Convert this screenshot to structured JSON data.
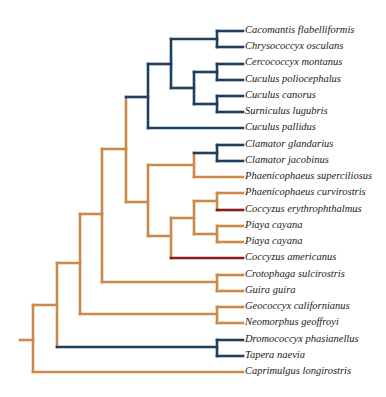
{
  "colors": {
    "orange": "#c98a4b",
    "blue": "#1f3f5e",
    "red": "#8b1a1a"
  },
  "tree": {
    "label_x": 245,
    "leaf_x": 243,
    "row_start_y": 31,
    "row_step": 16.24,
    "leaves": [
      {
        "label": "Cacomantis flabelliformis"
      },
      {
        "label": "Chrysococcyx osculans"
      },
      {
        "label": "Cercococcyx montanus"
      },
      {
        "label": "Cuculus poliocephalus"
      },
      {
        "label": "Cuculus canorus"
      },
      {
        "label": "Surniculus lugubris"
      },
      {
        "label": "Cuculus pallidus"
      },
      {
        "label": "Clamator glandarius"
      },
      {
        "label": "Clamator jacobinus"
      },
      {
        "label": "Phaenicophaeus superciliosus"
      },
      {
        "label": "Phaenicophaeus curvirostris"
      },
      {
        "label": "Coccyzus erythrophthalmus"
      },
      {
        "label": "Piaya cayana"
      },
      {
        "label": "Piaya cayana"
      },
      {
        "label": "Coccyzus americanus"
      },
      {
        "label": "Crotophaga sulcirostris"
      },
      {
        "label": "Guira guira"
      },
      {
        "label": "Geococcyx californianus"
      },
      {
        "label": "Neomorphus geoffroyi"
      },
      {
        "label": "Dromococcyx phasianellus"
      },
      {
        "label": "Tapera naevia"
      },
      {
        "label": "Caprimulgus longirostris"
      }
    ],
    "segments": [
      {
        "x1": 20,
        "y1": 340,
        "x2": 33,
        "y2": 340,
        "c": "orange"
      },
      {
        "x1": 33,
        "y1": 305,
        "x2": 33,
        "y2": 372,
        "c": "orange"
      },
      {
        "x1": 33,
        "y1": 372,
        "x2": 243,
        "y2": 372,
        "c": "orange"
      },
      {
        "x1": 33,
        "y1": 305,
        "x2": 57,
        "y2": 305,
        "c": "orange"
      },
      {
        "x1": 57,
        "y1": 263,
        "x2": 57,
        "y2": 347,
        "c": "orange"
      },
      {
        "x1": 57,
        "y1": 347,
        "x2": 217,
        "y2": 347,
        "c": "blue"
      },
      {
        "x1": 217,
        "y1": 340,
        "x2": 217,
        "y2": 356,
        "c": "blue"
      },
      {
        "x1": 217,
        "y1": 340,
        "x2": 243,
        "y2": 340,
        "c": "blue"
      },
      {
        "x1": 217,
        "y1": 356,
        "x2": 243,
        "y2": 356,
        "c": "blue"
      },
      {
        "x1": 57,
        "y1": 263,
        "x2": 80,
        "y2": 263,
        "c": "orange"
      },
      {
        "x1": 80,
        "y1": 214,
        "x2": 80,
        "y2": 314,
        "c": "orange"
      },
      {
        "x1": 80,
        "y1": 314,
        "x2": 217,
        "y2": 314,
        "c": "orange"
      },
      {
        "x1": 217,
        "y1": 307,
        "x2": 217,
        "y2": 323,
        "c": "orange"
      },
      {
        "x1": 217,
        "y1": 307,
        "x2": 243,
        "y2": 307,
        "c": "orange"
      },
      {
        "x1": 217,
        "y1": 323,
        "x2": 243,
        "y2": 323,
        "c": "orange"
      },
      {
        "x1": 80,
        "y1": 214,
        "x2": 102,
        "y2": 214,
        "c": "orange"
      },
      {
        "x1": 102,
        "y1": 149,
        "x2": 102,
        "y2": 282,
        "c": "orange"
      },
      {
        "x1": 102,
        "y1": 282,
        "x2": 217,
        "y2": 282,
        "c": "orange"
      },
      {
        "x1": 217,
        "y1": 275,
        "x2": 217,
        "y2": 291,
        "c": "orange"
      },
      {
        "x1": 217,
        "y1": 275,
        "x2": 243,
        "y2": 275,
        "c": "orange"
      },
      {
        "x1": 217,
        "y1": 291,
        "x2": 243,
        "y2": 291,
        "c": "orange"
      },
      {
        "x1": 102,
        "y1": 149,
        "x2": 126,
        "y2": 149,
        "c": "orange"
      },
      {
        "x1": 126,
        "y1": 97,
        "x2": 126,
        "y2": 202,
        "c": "orange"
      },
      {
        "x1": 126,
        "y1": 97,
        "x2": 148,
        "y2": 97,
        "c": "blue"
      },
      {
        "x1": 148,
        "y1": 64,
        "x2": 148,
        "y2": 128,
        "c": "blue"
      },
      {
        "x1": 148,
        "y1": 128,
        "x2": 243,
        "y2": 128,
        "c": "blue"
      },
      {
        "x1": 148,
        "y1": 64,
        "x2": 171,
        "y2": 64,
        "c": "blue"
      },
      {
        "x1": 171,
        "y1": 39,
        "x2": 171,
        "y2": 88,
        "c": "blue"
      },
      {
        "x1": 171,
        "y1": 39,
        "x2": 217,
        "y2": 39,
        "c": "blue"
      },
      {
        "x1": 217,
        "y1": 31,
        "x2": 217,
        "y2": 47,
        "c": "blue"
      },
      {
        "x1": 217,
        "y1": 31,
        "x2": 243,
        "y2": 31,
        "c": "blue"
      },
      {
        "x1": 217,
        "y1": 47,
        "x2": 243,
        "y2": 47,
        "c": "blue"
      },
      {
        "x1": 171,
        "y1": 88,
        "x2": 194,
        "y2": 88,
        "c": "blue"
      },
      {
        "x1": 194,
        "y1": 72,
        "x2": 194,
        "y2": 104,
        "c": "blue"
      },
      {
        "x1": 194,
        "y1": 72,
        "x2": 217,
        "y2": 72,
        "c": "blue"
      },
      {
        "x1": 217,
        "y1": 64,
        "x2": 217,
        "y2": 80,
        "c": "blue"
      },
      {
        "x1": 217,
        "y1": 64,
        "x2": 243,
        "y2": 64,
        "c": "blue"
      },
      {
        "x1": 217,
        "y1": 80,
        "x2": 243,
        "y2": 80,
        "c": "blue"
      },
      {
        "x1": 194,
        "y1": 104,
        "x2": 217,
        "y2": 104,
        "c": "blue"
      },
      {
        "x1": 217,
        "y1": 96,
        "x2": 217,
        "y2": 112,
        "c": "blue"
      },
      {
        "x1": 217,
        "y1": 96,
        "x2": 243,
        "y2": 96,
        "c": "blue"
      },
      {
        "x1": 217,
        "y1": 112,
        "x2": 243,
        "y2": 112,
        "c": "blue"
      },
      {
        "x1": 126,
        "y1": 202,
        "x2": 148,
        "y2": 202,
        "c": "orange"
      },
      {
        "x1": 148,
        "y1": 165,
        "x2": 148,
        "y2": 236,
        "c": "orange"
      },
      {
        "x1": 148,
        "y1": 165,
        "x2": 194,
        "y2": 165,
        "c": "orange"
      },
      {
        "x1": 194,
        "y1": 153,
        "x2": 194,
        "y2": 177,
        "c": "orange"
      },
      {
        "x1": 194,
        "y1": 177,
        "x2": 243,
        "y2": 177,
        "c": "orange"
      },
      {
        "x1": 194,
        "y1": 153,
        "x2": 217,
        "y2": 153,
        "c": "blue"
      },
      {
        "x1": 217,
        "y1": 145,
        "x2": 217,
        "y2": 161,
        "c": "blue"
      },
      {
        "x1": 217,
        "y1": 145,
        "x2": 243,
        "y2": 145,
        "c": "blue"
      },
      {
        "x1": 217,
        "y1": 161,
        "x2": 243,
        "y2": 161,
        "c": "blue"
      },
      {
        "x1": 148,
        "y1": 236,
        "x2": 171,
        "y2": 236,
        "c": "orange"
      },
      {
        "x1": 171,
        "y1": 218,
        "x2": 171,
        "y2": 258,
        "c": "orange"
      },
      {
        "x1": 171,
        "y1": 258,
        "x2": 243,
        "y2": 258,
        "c": "red"
      },
      {
        "x1": 171,
        "y1": 218,
        "x2": 194,
        "y2": 218,
        "c": "orange"
      },
      {
        "x1": 194,
        "y1": 201,
        "x2": 194,
        "y2": 234,
        "c": "orange"
      },
      {
        "x1": 194,
        "y1": 201,
        "x2": 217,
        "y2": 201,
        "c": "orange"
      },
      {
        "x1": 217,
        "y1": 193,
        "x2": 217,
        "y2": 210,
        "c": "orange"
      },
      {
        "x1": 217,
        "y1": 193,
        "x2": 243,
        "y2": 193,
        "c": "orange"
      },
      {
        "x1": 217,
        "y1": 210,
        "x2": 243,
        "y2": 210,
        "c": "red"
      },
      {
        "x1": 194,
        "y1": 234,
        "x2": 217,
        "y2": 234,
        "c": "orange"
      },
      {
        "x1": 217,
        "y1": 226,
        "x2": 217,
        "y2": 242,
        "c": "orange"
      },
      {
        "x1": 217,
        "y1": 226,
        "x2": 243,
        "y2": 226,
        "c": "orange"
      },
      {
        "x1": 217,
        "y1": 242,
        "x2": 243,
        "y2": 242,
        "c": "orange"
      }
    ]
  }
}
